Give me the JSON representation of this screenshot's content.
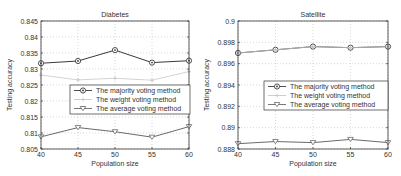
{
  "chart_data": [
    {
      "type": "line",
      "title": "Diabetes",
      "xlabel": "Population size",
      "ylabel": "Testing accuracy",
      "x": [
        40,
        45,
        50,
        55,
        60
      ],
      "xticks": [
        "40",
        "45",
        "50",
        "55",
        "60"
      ],
      "xlim": [
        40,
        60
      ],
      "ylim": [
        0.805,
        0.845
      ],
      "yticks": [
        "0.805",
        "0.81",
        "0.815",
        "0.82",
        "0.825",
        "0.83",
        "0.835",
        "0.84",
        "0.845"
      ],
      "grid": true,
      "legend_position": "center-right",
      "series": [
        {
          "name": "The majority voting method",
          "marker": "diamond",
          "color": "#3a3a3a",
          "values": [
            0.8318,
            0.8325,
            0.8359,
            0.832,
            0.8326
          ]
        },
        {
          "name": "The weight voting method",
          "marker": "plus",
          "color": "#c8c8c8",
          "values": [
            0.8281,
            0.8266,
            0.8271,
            0.8265,
            0.8292
          ]
        },
        {
          "name": "The average voting method",
          "marker": "triangle-down",
          "color": "#6a6a6a",
          "values": [
            0.8088,
            0.8117,
            0.8104,
            0.8087,
            0.812
          ]
        }
      ]
    },
    {
      "type": "line",
      "title": "Satellite",
      "xlabel": "Population size",
      "ylabel": "Testing accuracy",
      "x": [
        40,
        45,
        50,
        55,
        60
      ],
      "xticks": [
        "40",
        "45",
        "50",
        "55",
        "60"
      ],
      "xlim": [
        40,
        60
      ],
      "ylim": [
        0.888,
        0.9
      ],
      "yticks": [
        "0.888",
        "0.89",
        "0.892",
        "0.894",
        "0.896",
        "0.898",
        "0.9"
      ],
      "grid": true,
      "legend_position": "center-right",
      "series": [
        {
          "name": "The majority voting method",
          "marker": "diamond",
          "color": "#3a3a3a",
          "values": [
            0.897,
            0.8973,
            0.8976,
            0.8975,
            0.8976
          ]
        },
        {
          "name": "The weight voting method",
          "marker": "plus",
          "color": "#c8c8c8",
          "values": [
            0.897,
            0.8973,
            0.8976,
            0.8975,
            0.8976
          ]
        },
        {
          "name": "The average voting method",
          "marker": "triangle-down",
          "color": "#6a6a6a",
          "values": [
            0.8885,
            0.8887,
            0.8886,
            0.8889,
            0.8886
          ]
        }
      ]
    }
  ],
  "layout": {
    "plots": [
      {
        "x0": 41,
        "x1": 189,
        "y0": 21,
        "y1": 149,
        "legend": {
          "x": 70,
          "y": 85,
          "w": 120,
          "h": 29
        }
      },
      {
        "x0": 238,
        "x1": 388,
        "y0": 21,
        "y1": 149,
        "legend": {
          "x": 264,
          "y": 81,
          "w": 124,
          "h": 29
        }
      }
    ]
  }
}
